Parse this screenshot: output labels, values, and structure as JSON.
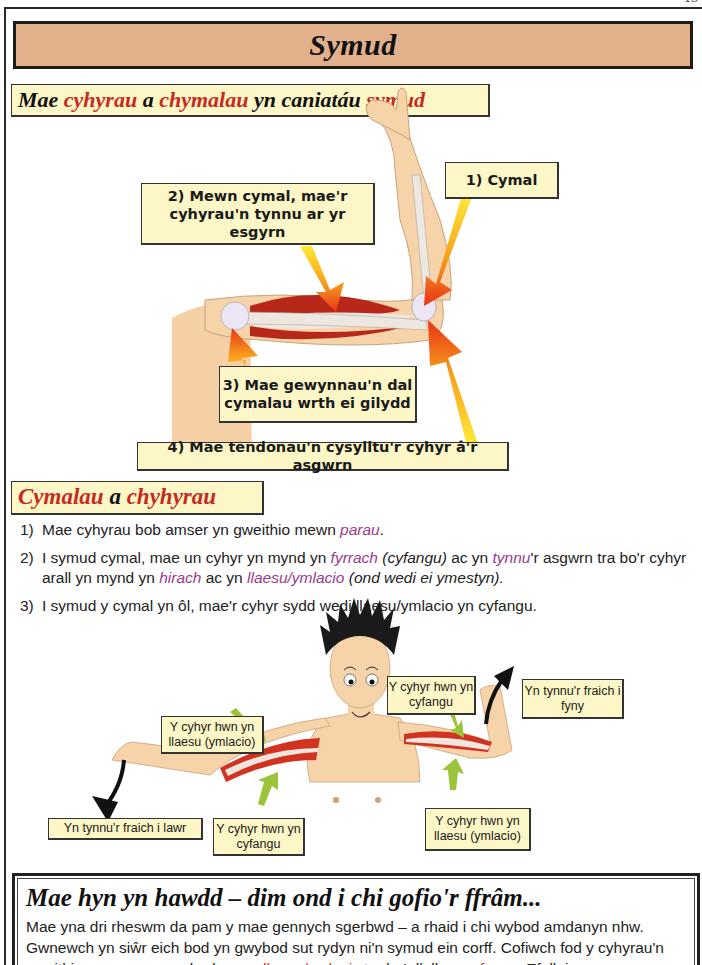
{
  "page": {
    "page_number": "15"
  },
  "title": "Symud",
  "section1": {
    "heading_parts": [
      {
        "text": "Mae ",
        "color": "black"
      },
      {
        "text": "cyhyrau",
        "color": "red"
      },
      {
        "text": " a ",
        "color": "black"
      },
      {
        "text": "chymalau",
        "color": "red"
      },
      {
        "text": " yn caniatáu ",
        "color": "black"
      },
      {
        "text": "symud",
        "color": "red"
      }
    ],
    "diagram": {
      "labels": {
        "joint": "1) Cymal",
        "muscles_pull": "2) Mewn cymal, mae'r cyhyrau'n tynnu ar yr esgyrn",
        "ligaments": "3) Mae gewynnau'n dal cymalau wrth ei gilydd",
        "tendons": "4) Mae tendonau'n cysylltu'r cyhyr â'r asgwrn"
      }
    }
  },
  "section2": {
    "heading_parts": [
      {
        "text": "Cymalau",
        "color": "red"
      },
      {
        "text": " a ",
        "color": "black"
      },
      {
        "text": "chyhyrau",
        "color": "red"
      }
    ],
    "list": [
      {
        "num": "1)",
        "parts": [
          {
            "text": "Mae cyhyrau bob amser yn gweithio mewn ",
            "style": "plain"
          },
          {
            "text": "parau",
            "style": "magenta-italic"
          },
          {
            "text": ".",
            "style": "plain"
          }
        ]
      },
      {
        "num": "2)",
        "parts": [
          {
            "text": "I symud cymal, mae un cyhyr yn mynd yn ",
            "style": "plain"
          },
          {
            "text": "fyrrach",
            "style": "magenta-italic"
          },
          {
            "text": " (cyfangu)",
            "style": "italic"
          },
          {
            "text": " ac yn ",
            "style": "plain"
          },
          {
            "text": "tynnu",
            "style": "magenta-italic"
          },
          {
            "text": "'r asgwrn tra bo'r cyhyr arall yn mynd yn ",
            "style": "plain"
          },
          {
            "text": "hirach",
            "style": "magenta-italic"
          },
          {
            "text": " ac yn ",
            "style": "plain"
          },
          {
            "text": "llaesu/ymlacio",
            "style": "magenta-italic"
          },
          {
            "text": " (ond wedi ei ymestyn).",
            "style": "italic"
          }
        ]
      },
      {
        "num": "3)",
        "parts": [
          {
            "text": "I symud y cymal yn ôl, mae'r cyhyr sydd wedi llaesu/ymlacio yn cyfangu.",
            "style": "plain"
          }
        ]
      }
    ],
    "diagram": {
      "labels": {
        "left_relaxing": "Y cyhyr hwn yn llaesu (ymlacio)",
        "left_contracting": "Y cyhyr hwn yn cyfangu",
        "left_arrow": "Yn tynnu'r fraich i lawr",
        "right_contracting": "Y cyhyr hwn yn cyfangu",
        "right_relaxing": "Y cyhyr hwn yn llaesu (ymlacio)",
        "right_arrow": "Yn tynnu'r fraich i fyny"
      }
    }
  },
  "tip": {
    "title": "Mae hyn yn hawdd – dim ond i chi gofio'r ffrâm...",
    "body_parts": [
      {
        "text": "Mae yna dri rheswm da pam y mae gennych sgerbwd – a rhaid i chi wybod amdanyn nhw. Gwnewch yn siŵr eich bod yn gwybod sut rydyn ni'n symud ein corff. Cofiwch fod y cyhyrau'n gweithio mewn ",
        "style": "plain"
      },
      {
        "text": "parau",
        "style": "red-underline"
      },
      {
        "text": " a bod un yn ",
        "style": "plain"
      },
      {
        "text": "llaesu/ymlacio",
        "style": "red-underline"
      },
      {
        "text": " tra bo'r llall yn ",
        "style": "plain"
      },
      {
        "text": "cyfangu",
        "style": "red-underline"
      },
      {
        "text": ". Efallai",
        "style": "plain"
      }
    ]
  },
  "colors": {
    "title_bg": "#e3b08c",
    "label_bg": "#fdf6c6",
    "heading_red": "#c62a20",
    "highlight_magenta": "#9b3a8e",
    "skin": "#f6d3a8",
    "muscle": "#c8301e",
    "arrow_green": "#9bc43a"
  }
}
